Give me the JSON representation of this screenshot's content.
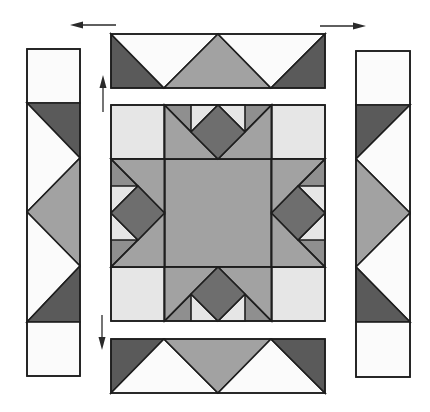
{
  "diagram": {
    "title": "",
    "colors": {
      "background": "#ffffff",
      "white_fabric": "#fbfbfb",
      "light_fabric": "#e6e6e6",
      "medium_fabric": "#a2a2a2",
      "medium_dark_fabric": "#8a8a8a",
      "dark_fabric": "#5a5a5a",
      "outline": "#1e1e1e"
    },
    "components": [
      {
        "id": "top-border-strip",
        "label": "Top border strip",
        "units": 4,
        "pattern": "flying geese: dark corners, white inverted triangles, medium center triangle"
      },
      {
        "id": "bottom-border-strip",
        "label": "Bottom border strip",
        "units": 4,
        "pattern": "flying geese: dark corners, white upright triangles, medium center triangle"
      },
      {
        "id": "left-border-strip",
        "label": "Left border strip",
        "units": 6,
        "pattern": "white square, dark/white/medium triangles, white square"
      },
      {
        "id": "right-border-strip",
        "label": "Right border strip",
        "units": 6,
        "pattern": "white square, dark/white/medium triangles, white square"
      },
      {
        "id": "center-star-block",
        "label": "Center star block",
        "grid": "4x4",
        "pattern": "light corner squares, medium center square, star points with dark diamonds"
      }
    ],
    "arrows": [
      {
        "id": "arrow-top-left",
        "direction": "left"
      },
      {
        "id": "arrow-top-right",
        "direction": "right"
      },
      {
        "id": "arrow-left-up",
        "direction": "up"
      },
      {
        "id": "arrow-left-down",
        "direction": "down"
      }
    ]
  }
}
